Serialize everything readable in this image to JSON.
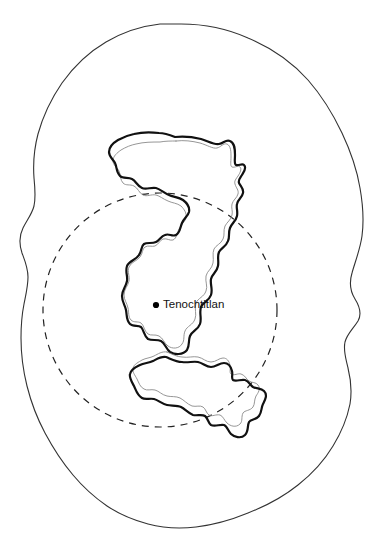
{
  "map": {
    "title": "Valley of Mexico lake system map",
    "background_color": "#ffffff",
    "width": 383,
    "height": 541,
    "outer_boundary": {
      "name": "valley-outline",
      "stroke_color": "#333333",
      "stroke_width": 1.1,
      "fill": "none",
      "bounds": {
        "left": 20,
        "top": 24,
        "right": 365,
        "bottom": 528
      }
    },
    "dashed_circle": {
      "name": "range-circle",
      "stroke_color": "#222222",
      "stroke_width": 1.2,
      "dash_pattern": "7,6",
      "center_x": 160,
      "center_y": 310,
      "radius": 117
    },
    "lake": {
      "name": "lake-texcoco-outline",
      "outer_stroke_color": "#111111",
      "outer_stroke_width": 2.2,
      "inner_stroke_color": "#8a8a8a",
      "inner_stroke_width": 0.9,
      "fill": "none"
    },
    "city_marker": {
      "label": "Tenochtitlan",
      "dot_color": "#000000",
      "dot_radius": 3.1,
      "dot_x": 156,
      "dot_y": 305,
      "label_x": 163,
      "label_y": 305,
      "label_color": "#111111",
      "label_size": 11.5
    }
  }
}
